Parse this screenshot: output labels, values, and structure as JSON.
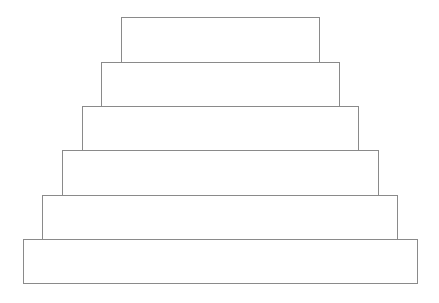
{
  "diagram": {
    "type": "stepped-pyramid",
    "line_color": "#8a8a8a",
    "background": "#ffffff",
    "tiers": [
      {
        "level": 1,
        "label": "",
        "x": 121,
        "y": 17,
        "w": 199,
        "h": 46
      },
      {
        "level": 2,
        "label": "",
        "x": 101,
        "y": 62,
        "w": 239,
        "h": 45
      },
      {
        "level": 3,
        "label": "",
        "x": 82,
        "y": 106,
        "w": 277,
        "h": 45
      },
      {
        "level": 4,
        "label": "",
        "x": 62,
        "y": 150,
        "w": 317,
        "h": 46
      },
      {
        "level": 5,
        "label": "",
        "x": 42,
        "y": 195,
        "w": 356,
        "h": 45
      },
      {
        "level": 6,
        "label": "",
        "x": 23,
        "y": 239,
        "w": 395,
        "h": 45
      }
    ]
  }
}
